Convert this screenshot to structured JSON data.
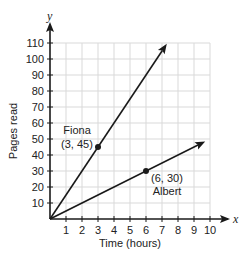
{
  "chart_data": {
    "type": "line",
    "title": "",
    "xlabel": "Time (hours)",
    "ylabel": "Pages read",
    "x_axis_letter": "x",
    "y_axis_letter": "y",
    "xlim": [
      0,
      10
    ],
    "ylim": [
      0,
      110
    ],
    "x_ticks": [
      1,
      2,
      3,
      4,
      5,
      6,
      7,
      8,
      9,
      10
    ],
    "y_ticks": [
      10,
      20,
      30,
      40,
      50,
      60,
      70,
      80,
      90,
      100,
      110
    ],
    "grid": true,
    "series": [
      {
        "name": "Fiona",
        "slope": 15,
        "points": [
          [
            0,
            0
          ],
          [
            3,
            45
          ]
        ],
        "labeled_point": {
          "x": 3,
          "y": 45,
          "label": "(3, 45)"
        },
        "arrow_end": [
          7.3,
          109.5
        ]
      },
      {
        "name": "Albert",
        "slope": 5,
        "points": [
          [
            0,
            0
          ],
          [
            6,
            30
          ]
        ],
        "labeled_point": {
          "x": 6,
          "y": 30,
          "label": "(6, 30)"
        },
        "arrow_end": [
          9.7,
          48.5
        ]
      }
    ]
  },
  "colors": {
    "grid": "#d9d9d9",
    "axis": "#1a1a1a",
    "line": "#1a1a1a"
  }
}
